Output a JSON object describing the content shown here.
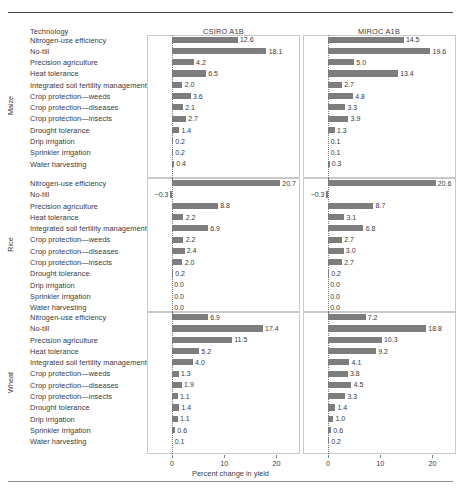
{
  "header": {
    "row_header_label": "Technology",
    "columns": [
      "CSIRO A1B",
      "MIROC A1B"
    ]
  },
  "axis": {
    "title": "Percent change in yield",
    "ticks": [
      "0",
      "10",
      "20"
    ],
    "tick_values": [
      0,
      10,
      20
    ]
  },
  "colors": {
    "bar": "#7d7d7d",
    "frame": "#c9c9c9",
    "text": "#3a3a3a",
    "zero_line": "#777777"
  },
  "crops": [
    "Maize",
    "Rice",
    "Wheat"
  ],
  "technologies": [
    "Nitrogen-use efficiency",
    "No-till",
    "Precision agriculture",
    "Heat tolerance",
    "Integrated soil fertility management",
    "Crop protection—weeds",
    "Crop protection—diseases",
    "Crop protection—insects",
    "Drought tolerance",
    "Drip irrigation",
    "Sprinkler irrigation",
    "Water harvesting"
  ],
  "chart_data": {
    "type": "bar",
    "orientation": "horizontal",
    "title": "",
    "xlabel": "Percent change in yield",
    "ylabel": "",
    "xlim": [
      -2,
      25
    ],
    "xticks": [
      0,
      10,
      20
    ],
    "grid": false,
    "legend": "none",
    "panel_rows": [
      "Maize",
      "Rice",
      "Wheat"
    ],
    "panel_cols": [
      "CSIRO A1B",
      "MIROC A1B"
    ],
    "categories": [
      "Nitrogen-use efficiency",
      "No-till",
      "Precision agriculture",
      "Heat tolerance",
      "Integrated soil fertility management",
      "Crop protection—weeds",
      "Crop protection—diseases",
      "Crop protection—insects",
      "Drought tolerance",
      "Drip irrigation",
      "Sprinkler irrigation",
      "Water harvesting"
    ],
    "panels": [
      {
        "crop": "Maize",
        "series": [
          {
            "name": "CSIRO A1B",
            "values": [
              12.6,
              18.1,
              4.2,
              6.5,
              2.0,
              3.6,
              2.1,
              2.7,
              1.4,
              0.2,
              0.2,
              0.4
            ],
            "labels": [
              "12.6",
              "18.1",
              "4.2",
              "6.5",
              "2.0",
              "3.6",
              "2.1",
              "2.7",
              "1.4",
              "0.2",
              "0.2",
              "0.4"
            ]
          },
          {
            "name": "MIROC A1B",
            "values": [
              14.5,
              19.6,
              5.0,
              13.4,
              2.7,
              4.8,
              3.3,
              3.9,
              1.3,
              0.1,
              0.1,
              0.3
            ],
            "labels": [
              "14.5",
              "19.6",
              "5.0",
              "13.4",
              "2.7",
              "4.8",
              "3.3",
              "3.9",
              "1.3",
              "0.1",
              "0.1",
              "0.3"
            ]
          }
        ]
      },
      {
        "crop": "Rice",
        "series": [
          {
            "name": "CSIRO A1B",
            "values": [
              20.7,
              -0.3,
              8.8,
              2.2,
              6.9,
              2.2,
              2.4,
              2.0,
              0.2,
              0.0,
              0.0,
              0.0
            ],
            "labels": [
              "20.7",
              "−0.3",
              "8.8",
              "2.2",
              "6.9",
              "2.2",
              "2.4",
              "2.0",
              "0.2",
              "0.0",
              "0.0",
              "0.0"
            ]
          },
          {
            "name": "MIROC A1B",
            "values": [
              20.6,
              -0.3,
              8.7,
              3.1,
              6.8,
              2.7,
              3.0,
              2.7,
              0.2,
              0.0,
              0.0,
              0.0
            ],
            "labels": [
              "20.6",
              "−0.3",
              "8.7",
              "3.1",
              "6.8",
              "2.7",
              "3.0",
              "2.7",
              "0.2",
              "0.0",
              "0.0",
              "0.0"
            ]
          }
        ]
      },
      {
        "crop": "Wheat",
        "series": [
          {
            "name": "CSIRO A1B",
            "values": [
              6.9,
              17.4,
              11.5,
              5.2,
              4.0,
              1.3,
              1.9,
              1.1,
              1.4,
              1.1,
              0.6,
              0.1
            ],
            "labels": [
              "6.9",
              "17.4",
              "11.5",
              "5.2",
              "4.0",
              "1.3",
              "1.9",
              "1.1",
              "1.4",
              "1.1",
              "0.6",
              "0.1"
            ]
          },
          {
            "name": "MIROC A1B",
            "values": [
              7.2,
              18.8,
              10.3,
              9.2,
              4.1,
              3.8,
              4.5,
              3.3,
              1.4,
              1.0,
              0.6,
              0.2
            ],
            "labels": [
              "7.2",
              "18.8",
              "10.3",
              "9.2",
              "4.1",
              "3.8",
              "4.5",
              "3.3",
              "1.4",
              "1.0",
              "0.6",
              "0.2"
            ]
          }
        ]
      }
    ]
  }
}
